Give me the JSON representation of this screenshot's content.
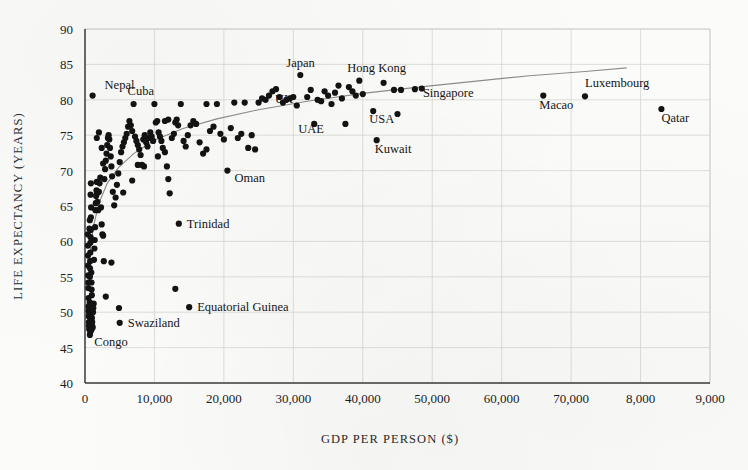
{
  "figure": {
    "name": "gdp-per-person-vs-life-expectancy-scatter"
  },
  "chart_data": {
    "type": "scatter",
    "title": "",
    "xlabel": "GDP PER PERSON ($)",
    "ylabel": "LIFE EXPECTANCY (YEARS)",
    "xlim": [
      0,
      90000
    ],
    "ylim": [
      40,
      90
    ],
    "grid": true,
    "legend": "none",
    "xticks": [
      0,
      10000,
      20000,
      30000,
      40000,
      50000,
      60000,
      70000,
      80000,
      90000
    ],
    "xticklabels": [
      "0",
      "10,000",
      "20,000",
      "30,000",
      "40,000",
      "50,000",
      "60,000",
      "70,000",
      "8,000",
      "9,000"
    ],
    "yticks": [
      40,
      45,
      50,
      55,
      60,
      65,
      70,
      75,
      80,
      85,
      90
    ],
    "yticklabels": [
      "40",
      "45",
      "50",
      "55",
      "60",
      "65",
      "70",
      "75",
      "80",
      "85",
      "90"
    ],
    "trendline": {
      "description": "logarithmic fit",
      "points": [
        [
          700,
          58.2
        ],
        [
          1200,
          62.0
        ],
        [
          2000,
          65.4
        ],
        [
          3200,
          68.2
        ],
        [
          4800,
          70.4
        ],
        [
          7000,
          72.4
        ],
        [
          10000,
          74.3
        ],
        [
          14000,
          75.9
        ],
        [
          19000,
          77.3
        ],
        [
          25000,
          78.6
        ],
        [
          32000,
          79.8
        ],
        [
          40000,
          80.9
        ],
        [
          48000,
          81.8
        ],
        [
          56000,
          82.6
        ],
        [
          64000,
          83.4
        ],
        [
          72000,
          84.0
        ],
        [
          78000,
          84.5
        ]
      ]
    },
    "annotations": [
      {
        "label": "Nepal",
        "x": 1100,
        "y": 80.6,
        "label_dx": 12,
        "label_dy": -7
      },
      {
        "label": "Cuba",
        "x": 7000,
        "y": 79.4,
        "label_dx": -6,
        "label_dy": -9
      },
      {
        "label": "Japan",
        "x": 31000,
        "y": 83.5,
        "label_dx": -14,
        "label_dy": -8
      },
      {
        "label": "Hong Kong",
        "x": 39500,
        "y": 82.7,
        "label_dx": -12,
        "label_dy": -9
      },
      {
        "label": "UK",
        "x": 26500,
        "y": 80.6,
        "label_dx": 6,
        "label_dy": 7
      },
      {
        "label": "Singapore",
        "x": 47500,
        "y": 81.5,
        "label_dx": 8,
        "label_dy": 8
      },
      {
        "label": "Macao",
        "x": 66000,
        "y": 80.6,
        "label_dx": -4,
        "label_dy": 13
      },
      {
        "label": "Luxembourg",
        "x": 72000,
        "y": 80.5,
        "label_dx": 0,
        "label_dy": -9
      },
      {
        "label": "Qatar",
        "x": 83000,
        "y": 78.7,
        "label_dx": 0,
        "label_dy": 13
      },
      {
        "label": "UAE",
        "x": 33000,
        "y": 76.6,
        "label_dx": -16,
        "label_dy": 9
      },
      {
        "label": "USA",
        "x": 41500,
        "y": 78.4,
        "label_dx": -4,
        "label_dy": 12
      },
      {
        "label": "Kuwait",
        "x": 42000,
        "y": 74.3,
        "label_dx": -2,
        "label_dy": 13
      },
      {
        "label": "Oman",
        "x": 20500,
        "y": 70.0,
        "label_dx": 7,
        "label_dy": 11
      },
      {
        "label": "Trinidad",
        "x": 13500,
        "y": 62.5,
        "label_dx": 8,
        "label_dy": 4
      },
      {
        "label": "Equatorial Guinea",
        "x": 15000,
        "y": 50.7,
        "label_dx": 8,
        "label_dy": 4
      },
      {
        "label": "Swaziland",
        "x": 5000,
        "y": 48.5,
        "label_dx": 8,
        "label_dy": 4
      },
      {
        "label": "Congo",
        "x": 900,
        "y": 47.5,
        "label_dx": 3,
        "label_dy": 16
      }
    ],
    "points": [
      [
        1100,
        80.6
      ],
      [
        7000,
        79.4
      ],
      [
        31000,
        83.5
      ],
      [
        39500,
        82.7
      ],
      [
        26500,
        80.6
      ],
      [
        47500,
        81.5
      ],
      [
        66000,
        80.6
      ],
      [
        72000,
        80.5
      ],
      [
        83000,
        78.7
      ],
      [
        33000,
        76.6
      ],
      [
        41500,
        78.4
      ],
      [
        42000,
        74.3
      ],
      [
        20500,
        70.0
      ],
      [
        13500,
        62.5
      ],
      [
        15000,
        50.7
      ],
      [
        5000,
        48.5
      ],
      [
        900,
        47.5
      ],
      [
        400,
        61.0
      ],
      [
        420,
        59.4
      ],
      [
        430,
        58.0
      ],
      [
        450,
        56.6
      ],
      [
        460,
        55.2
      ],
      [
        470,
        54.2
      ],
      [
        480,
        53.4
      ],
      [
        500,
        52.0
      ],
      [
        510,
        50.8
      ],
      [
        520,
        50.2
      ],
      [
        540,
        49.4
      ],
      [
        560,
        48.6
      ],
      [
        580,
        48.1
      ],
      [
        600,
        47.6
      ],
      [
        620,
        49.8
      ],
      [
        640,
        50.4
      ],
      [
        660,
        51.0
      ],
      [
        680,
        51.4
      ],
      [
        700,
        55.0
      ],
      [
        720,
        56.2
      ],
      [
        740,
        57.2
      ],
      [
        760,
        58.4
      ],
      [
        780,
        59.8
      ],
      [
        800,
        60.6
      ],
      [
        820,
        61.6
      ],
      [
        850,
        63.4
      ],
      [
        880,
        64.8
      ],
      [
        900,
        55.6
      ],
      [
        930,
        54.2
      ],
      [
        950,
        53.2
      ],
      [
        980,
        52.4
      ],
      [
        1000,
        49.2
      ],
      [
        1030,
        48.6
      ],
      [
        1060,
        48.0
      ],
      [
        1100,
        47.8
      ],
      [
        1150,
        50.0
      ],
      [
        1200,
        50.6
      ],
      [
        1250,
        51.2
      ],
      [
        1300,
        57.4
      ],
      [
        1350,
        59.0
      ],
      [
        1400,
        60.2
      ],
      [
        1450,
        62.0
      ],
      [
        1500,
        64.4
      ],
      [
        1550,
        65.4
      ],
      [
        1600,
        66.4
      ],
      [
        1650,
        67.2
      ],
      [
        1700,
        68.4
      ],
      [
        1750,
        66.8
      ],
      [
        1800,
        65.6
      ],
      [
        1900,
        64.4
      ],
      [
        2000,
        67.0
      ],
      [
        2100,
        68.2
      ],
      [
        2200,
        69.0
      ],
      [
        2300,
        64.8
      ],
      [
        2400,
        62.4
      ],
      [
        2500,
        61.0
      ],
      [
        2600,
        60.8
      ],
      [
        2700,
        57.2
      ],
      [
        2800,
        68.8
      ],
      [
        2900,
        70.2
      ],
      [
        3000,
        71.4
      ],
      [
        3100,
        72.4
      ],
      [
        3200,
        73.6
      ],
      [
        3300,
        74.6
      ],
      [
        3400,
        75.0
      ],
      [
        3500,
        74.4
      ],
      [
        3600,
        73.2
      ],
      [
        3700,
        72.0
      ],
      [
        3800,
        70.6
      ],
      [
        3900,
        69.2
      ],
      [
        4000,
        67.0
      ],
      [
        4200,
        65.1
      ],
      [
        4400,
        66.2
      ],
      [
        4600,
        68.0
      ],
      [
        4800,
        69.6
      ],
      [
        5000,
        71.2
      ],
      [
        5200,
        72.6
      ],
      [
        5400,
        73.4
      ],
      [
        5600,
        74.0
      ],
      [
        5800,
        74.6
      ],
      [
        6000,
        75.2
      ],
      [
        6200,
        76.2
      ],
      [
        6400,
        77.0
      ],
      [
        6600,
        76.4
      ],
      [
        6800,
        75.6
      ],
      [
        7200,
        74.8
      ],
      [
        7400,
        74.2
      ],
      [
        7600,
        73.6
      ],
      [
        7800,
        73.0
      ],
      [
        8000,
        72.2
      ],
      [
        8200,
        70.8
      ],
      [
        8400,
        74.4
      ],
      [
        8600,
        75.0
      ],
      [
        8800,
        74.0
      ],
      [
        9000,
        73.4
      ],
      [
        9200,
        74.6
      ],
      [
        9400,
        75.4
      ],
      [
        9600,
        74.8
      ],
      [
        9800,
        74.2
      ],
      [
        10000,
        79.4
      ],
      [
        10200,
        76.8
      ],
      [
        10400,
        77.0
      ],
      [
        10600,
        75.4
      ],
      [
        10800,
        74.8
      ],
      [
        11000,
        74.2
      ],
      [
        11200,
        73.2
      ],
      [
        11500,
        72.6
      ],
      [
        11800,
        70.6
      ],
      [
        12000,
        68.8
      ],
      [
        12200,
        66.8
      ],
      [
        12500,
        74.6
      ],
      [
        12800,
        75.2
      ],
      [
        13000,
        76.8
      ],
      [
        13200,
        77.2
      ],
      [
        13400,
        76.4
      ],
      [
        13800,
        79.4
      ],
      [
        14200,
        74.2
      ],
      [
        14500,
        73.4
      ],
      [
        14800,
        75.0
      ],
      [
        15200,
        76.4
      ],
      [
        15600,
        77.0
      ],
      [
        16000,
        76.6
      ],
      [
        16500,
        74.0
      ],
      [
        17000,
        72.4
      ],
      [
        17500,
        73.0
      ],
      [
        18000,
        75.6
      ],
      [
        18500,
        76.2
      ],
      [
        19000,
        79.4
      ],
      [
        19500,
        75.2
      ],
      [
        20000,
        74.4
      ],
      [
        21000,
        76.0
      ],
      [
        22000,
        74.6
      ],
      [
        22500,
        75.2
      ],
      [
        23000,
        79.6
      ],
      [
        23500,
        73.2
      ],
      [
        24000,
        75.0
      ],
      [
        24500,
        73.0
      ],
      [
        25000,
        79.6
      ],
      [
        25500,
        80.2
      ],
      [
        26000,
        80.0
      ],
      [
        27000,
        81.2
      ],
      [
        27500,
        81.5
      ],
      [
        28000,
        80.4
      ],
      [
        28500,
        79.6
      ],
      [
        29000,
        80.0
      ],
      [
        29500,
        80.2
      ],
      [
        30000,
        80.4
      ],
      [
        30500,
        79.2
      ],
      [
        32000,
        80.4
      ],
      [
        32500,
        81.4
      ],
      [
        33500,
        80.0
      ],
      [
        34000,
        79.8
      ],
      [
        34500,
        81.2
      ],
      [
        35000,
        80.6
      ],
      [
        35500,
        79.4
      ],
      [
        36000,
        81.0
      ],
      [
        36500,
        82.0
      ],
      [
        37000,
        80.2
      ],
      [
        37500,
        76.6
      ],
      [
        38000,
        81.8
      ],
      [
        38500,
        81.2
      ],
      [
        39000,
        80.6
      ],
      [
        40000,
        80.8
      ],
      [
        43000,
        82.4
      ],
      [
        44500,
        81.4
      ],
      [
        45500,
        81.4
      ],
      [
        45000,
        78.0
      ],
      [
        48500,
        81.6
      ],
      [
        3000,
        52.2
      ],
      [
        4900,
        50.6
      ],
      [
        3800,
        57.0
      ],
      [
        13000,
        53.3
      ],
      [
        800,
        66.6
      ],
      [
        850,
        68.2
      ],
      [
        1700,
        74.6
      ],
      [
        2000,
        75.4
      ],
      [
        2400,
        73.2
      ],
      [
        2600,
        71.0
      ],
      [
        5500,
        66.9
      ],
      [
        6800,
        68.6
      ],
      [
        7600,
        70.8
      ],
      [
        8500,
        70.6
      ],
      [
        10500,
        72.0
      ],
      [
        11500,
        77.0
      ],
      [
        12000,
        77.2
      ],
      [
        17500,
        79.4
      ],
      [
        21500,
        79.6
      ],
      [
        700,
        46.8
      ],
      [
        760,
        47.2
      ],
      [
        640,
        61.8
      ],
      [
        690,
        63.0
      ]
    ]
  }
}
